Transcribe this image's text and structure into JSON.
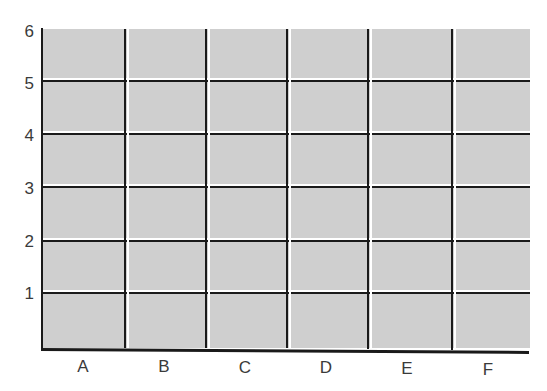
{
  "diagram": {
    "type": "grid",
    "fill_color": "#cfcfcf",
    "line_color": "#1a1a1a",
    "highlight_color": "#ffffff",
    "rows": 6,
    "columns": 6,
    "y_axis": {
      "labels": [
        "1",
        "2",
        "3",
        "4",
        "5",
        "6"
      ]
    },
    "x_axis": {
      "labels": [
        "A",
        "B",
        "C",
        "D",
        "E",
        "F"
      ]
    }
  }
}
